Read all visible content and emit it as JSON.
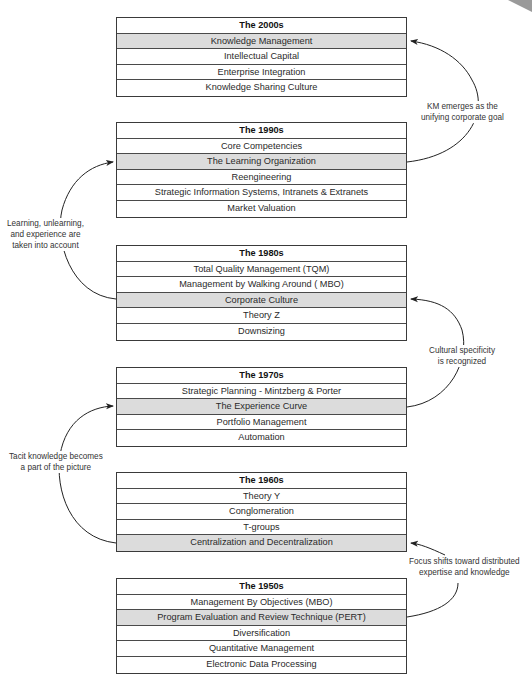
{
  "decades": [
    {
      "title": "The 2000s",
      "top": 17,
      "highlight": 0,
      "items": [
        "Knowledge Management",
        "Intellectual Capital",
        "Enterprise Integration",
        "Knowledge Sharing Culture"
      ]
    },
    {
      "title": "The 1990s",
      "top": 122,
      "highlight": 1,
      "items": [
        "Core Competencies",
        "The Learning Organization",
        "Reengineering",
        "Strategic Information Systems, Intranets & Extranets",
        "Market Valuation"
      ]
    },
    {
      "title": "The 1980s",
      "top": 245,
      "highlight": 2,
      "items": [
        "Total Quality Management (TQM)",
        "Management by Walking Around ( MBO)",
        "Corporate Culture",
        "Theory Z",
        "Downsizing"
      ]
    },
    {
      "title": "The 1970s",
      "top": 367,
      "highlight": 1,
      "items": [
        "Strategic Planning -  Mintzberg & Porter",
        "The Experience Curve",
        "Portfolio Management",
        "Automation"
      ]
    },
    {
      "title": "The 1960s",
      "top": 472,
      "highlight": 3,
      "items": [
        "Theory Y",
        "Conglomeration",
        "T-groups",
        "Centralization and Decentralization"
      ]
    },
    {
      "title": "The 1950s",
      "top": 578,
      "highlight": 1,
      "items": [
        "Management By Objectives (MBO)",
        "Program Evaluation and Review Technique (PERT)",
        "Diversification",
        "Quantitative Management",
        "Electronic Data Processing"
      ]
    }
  ],
  "notes": {
    "km": "KM emerges as the\nunifying corporate goal",
    "learning": "Learning, unlearning,\nand experience are\ntaken into account",
    "cultural": "Cultural specificity\nis recognized",
    "tacit": "Tacit knowledge becomes\na part of the picture",
    "focus": "Focus shifts toward    distributed\nexpertise  and knowledge"
  },
  "colors": {
    "highlight": "#dcdcdc",
    "border": "#3a3a3a",
    "arrow": "#222222"
  }
}
